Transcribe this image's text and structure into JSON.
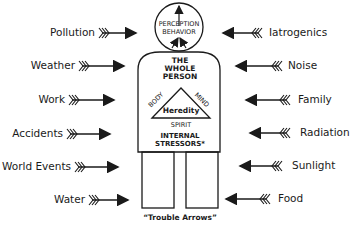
{
  "diagram": {
    "title": "The Whole Person",
    "head": {
      "line1": "PERCEPTION",
      "line2": "BEHAVIOR"
    },
    "body_title": [
      "THE",
      "WHOLE",
      "PERSON"
    ],
    "triangle": {
      "left": "BODY",
      "right": "MIND",
      "bottom": "SPIRIT",
      "center": "Heredity"
    },
    "internal": [
      "INTERNAL",
      "STRESSORS*"
    ],
    "caption": "“Trouble Arrows”",
    "left_stressors": [
      {
        "label": "Pollution"
      },
      {
        "label": "Weather"
      },
      {
        "label": "Work"
      },
      {
        "label": "Accidents"
      },
      {
        "label": "World Events"
      },
      {
        "label": "Water"
      }
    ],
    "right_stressors": [
      {
        "label": "Iatrogenics"
      },
      {
        "label": "Noise"
      },
      {
        "label": "Family"
      },
      {
        "label": "Radiation"
      },
      {
        "label": "Sunlight"
      },
      {
        "label": "Food"
      }
    ],
    "colors": {
      "ink": "#1a1a1a",
      "background": "#ffffff"
    }
  }
}
